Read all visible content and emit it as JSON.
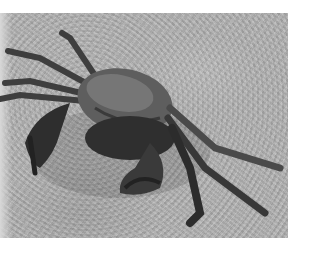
{
  "image": {
    "subject": "crab",
    "description": "Grayscale photograph of a crab on a textured sandy/concrete surface",
    "colors": {
      "background": "#ffffff",
      "ground": "#b0b0b0",
      "crab_dark": "#2a2a2a",
      "crab_mid": "#5a5a5a",
      "crab_light": "#8a8a8a"
    }
  }
}
